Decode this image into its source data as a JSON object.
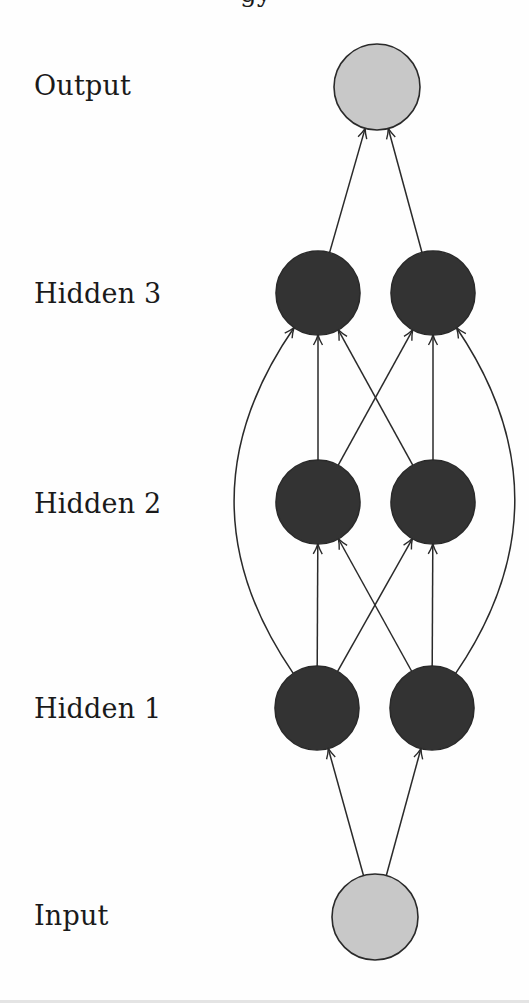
{
  "diagram": {
    "title_fragment": "gy",
    "colors": {
      "io_node_fill": "#c8c8c8",
      "hidden_node_fill": "#333333",
      "node_stroke": "#2a2a2a",
      "edge": "#2a2a2a",
      "label": "#1a1a1a"
    },
    "layers": [
      {
        "id": "output",
        "label": "Output",
        "label_top": 72,
        "node_type": "io",
        "nodes": [
          {
            "id": "out",
            "cx": 377,
            "cy": 87,
            "r": 43
          }
        ]
      },
      {
        "id": "hidden3",
        "label": "Hidden 3",
        "label_top": 280,
        "node_type": "hidden",
        "nodes": [
          {
            "id": "h3a",
            "cx": 318,
            "cy": 293,
            "r": 42
          },
          {
            "id": "h3b",
            "cx": 433,
            "cy": 293,
            "r": 42
          }
        ]
      },
      {
        "id": "hidden2",
        "label": "Hidden 2",
        "label_top": 490,
        "node_type": "hidden",
        "nodes": [
          {
            "id": "h2a",
            "cx": 318,
            "cy": 502,
            "r": 42
          },
          {
            "id": "h2b",
            "cx": 433,
            "cy": 502,
            "r": 42
          }
        ]
      },
      {
        "id": "hidden1",
        "label": "Hidden 1",
        "label_top": 695,
        "node_type": "hidden",
        "nodes": [
          {
            "id": "h1a",
            "cx": 317,
            "cy": 708,
            "r": 42
          },
          {
            "id": "h1b",
            "cx": 432,
            "cy": 708,
            "r": 42
          }
        ]
      },
      {
        "id": "input",
        "label": "Input",
        "label_top": 902,
        "node_type": "io",
        "nodes": [
          {
            "id": "in",
            "cx": 375,
            "cy": 917,
            "r": 43
          }
        ]
      }
    ],
    "edges": [
      {
        "from": "in",
        "to": "h1a",
        "kind": "straight"
      },
      {
        "from": "in",
        "to": "h1b",
        "kind": "straight"
      },
      {
        "from": "h1a",
        "to": "h2a",
        "kind": "straight"
      },
      {
        "from": "h1a",
        "to": "h2b",
        "kind": "straight"
      },
      {
        "from": "h1b",
        "to": "h2a",
        "kind": "straight"
      },
      {
        "from": "h1b",
        "to": "h2b",
        "kind": "straight"
      },
      {
        "from": "h2a",
        "to": "h3a",
        "kind": "straight"
      },
      {
        "from": "h2a",
        "to": "h3b",
        "kind": "straight"
      },
      {
        "from": "h2b",
        "to": "h3a",
        "kind": "straight"
      },
      {
        "from": "h2b",
        "to": "h3b",
        "kind": "straight"
      },
      {
        "from": "h1a",
        "to": "h3a",
        "kind": "skip-curve",
        "bulge_x": 246
      },
      {
        "from": "h1b",
        "to": "h3b",
        "kind": "skip-curve",
        "bulge_x": 503
      },
      {
        "from": "h3a",
        "to": "out",
        "kind": "straight"
      },
      {
        "from": "h3b",
        "to": "out",
        "kind": "straight"
      }
    ]
  }
}
